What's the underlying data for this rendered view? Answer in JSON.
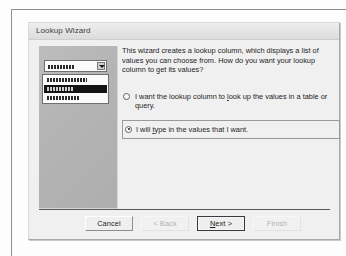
{
  "window": {
    "title": "Lookup Wizard"
  },
  "content": {
    "intro": "This wizard creates a lookup column, which displays a list of values you can choose from.  How do you want your lookup column to get its values?",
    "options": [
      {
        "id": "lookup-from-table",
        "label_pre": "I want the lookup column to ",
        "label_accel": "l",
        "label_post": "ook up the values in a table or query.",
        "selected": false
      },
      {
        "id": "type-values",
        "label_pre": "I will ",
        "label_accel": "t",
        "label_post": "ype in the values that I want.",
        "selected": true
      }
    ]
  },
  "illustration": {
    "combo_rows": [
      "row-long",
      "row-selected",
      "row-medium"
    ],
    "selected_row_index": 1,
    "dropdown_icon": "chevron-down-icon"
  },
  "footer": {
    "buttons": [
      {
        "id": "cancel",
        "label": "Cancel",
        "disabled": false,
        "default": false
      },
      {
        "id": "back",
        "label": "< Back",
        "disabled": true,
        "default": false
      },
      {
        "id": "next",
        "label_pre": "",
        "label_accel": "N",
        "label_post": "ext >",
        "disabled": false,
        "default": true
      },
      {
        "id": "finish",
        "label": "Finish",
        "disabled": true,
        "default": false
      }
    ]
  },
  "colors": {
    "dialog_face": "#f0f0f0",
    "titlebar": "#e4e4e4",
    "illustration_panel": "#b4b4b4",
    "selection": "#151515",
    "text": "#1d1d1d",
    "disabled_text": "#b2b2b2"
  }
}
